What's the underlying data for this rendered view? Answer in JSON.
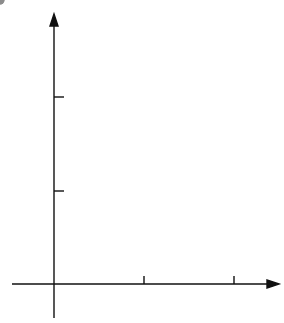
{
  "figure": {
    "bullet": "•",
    "axis_labels": {
      "x": "x",
      "y": "y"
    },
    "tick_labels": {
      "x": [
        "0",
        "1",
        "2"
      ],
      "y": [
        "1",
        "2"
      ]
    },
    "points": [
      {
        "name": "P",
        "sub": "1",
        "x": 0.39,
        "y": 1.1
      },
      {
        "name": "P",
        "sub": "2",
        "x": 1.88,
        "y": 1.28
      }
    ]
  },
  "chart_data": {
    "type": "line",
    "title": "",
    "xlabel": "x",
    "ylabel": "y",
    "xlim": [
      -0.4,
      2.2
    ],
    "ylim": [
      -0.35,
      2.3
    ],
    "grid": true,
    "grid_step": 0.2,
    "x_ticks": [
      0,
      1,
      2
    ],
    "y_ticks": [
      1,
      2
    ],
    "series": [
      {
        "name": "curve",
        "x": [
          -0.15,
          0,
          0.2,
          0.39,
          0.6,
          0.8,
          1.0,
          1.2,
          1.4,
          1.6,
          1.88,
          2.0,
          2.1
        ],
        "y": [
          -0.35,
          0.02,
          0.62,
          1.1,
          1.55,
          1.82,
          1.89,
          1.82,
          1.65,
          1.45,
          1.28,
          1.23,
          1.23
        ]
      }
    ],
    "annotations": [
      {
        "label": "P1",
        "x": 0.39,
        "y": 1.1
      },
      {
        "label": "P2",
        "x": 1.88,
        "y": 1.28
      }
    ]
  }
}
